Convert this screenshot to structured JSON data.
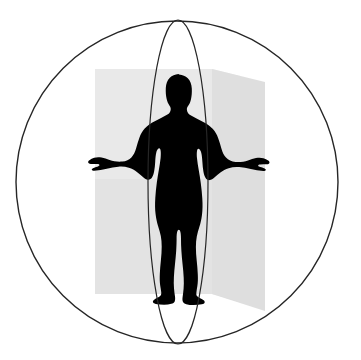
{
  "image": {
    "title": "Human body in anatomical reference planes within a sphere",
    "width": 361,
    "height": 360,
    "background_color": "#ffffff"
  },
  "colors": {
    "background": "#ffffff",
    "silhouette": "#000000",
    "outline_stroke": "#262626",
    "frontal_plane": "#e2e2e2",
    "sagittal_plane": "#d8d8d8",
    "plane_edge": "#cfcfcf"
  },
  "geometry": {
    "sphere": {
      "label": "outer-circle",
      "center_x": 177,
      "center_y": 182,
      "radius": 161,
      "stroke_width": 1.4
    },
    "sagittal_ellipse": {
      "label": "vertical-ellipse",
      "center_x": 178,
      "center_y": 182,
      "radius_x": 30,
      "radius_y": 162,
      "stroke_width": 1.2
    },
    "frontal_plane": {
      "label": "frontal-plane-rectangle",
      "x": 95,
      "y": 69,
      "width": 117,
      "height": 225,
      "opacity": 0.62
    },
    "sagittal_plane": {
      "label": "sagittal-plane-parallelogram",
      "points": "212,69 265,82 265,311 212,294",
      "opacity": 0.58
    }
  },
  "silhouette": {
    "label": "human-figure-silhouette",
    "head_top_y": 74,
    "feet_bottom_y": 306,
    "arm_span_left_x": 88,
    "arm_span_right_x": 278,
    "fill": "#000000"
  }
}
